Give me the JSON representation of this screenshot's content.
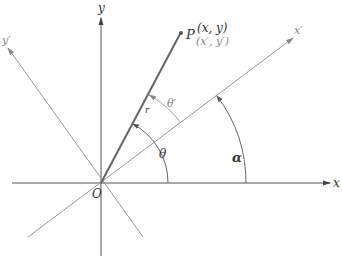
{
  "diagram": {
    "type": "coordinate-rotation",
    "origin": {
      "label": "O",
      "x": 101,
      "y": 183
    },
    "axes": {
      "x": {
        "label": "x",
        "color": "#555555"
      },
      "y": {
        "label": "y",
        "color": "#555555"
      },
      "x_prime": {
        "label": "x′",
        "color": "#999999"
      },
      "y_prime": {
        "label": "y′",
        "color": "#999999"
      }
    },
    "point": {
      "label": "P",
      "coords": "(x, y)",
      "coords_prime": "(x′, y′)",
      "x": 181,
      "y": 33
    },
    "radius_label": "r",
    "angles": {
      "theta": "θ",
      "theta_prime": "θ′",
      "alpha": "α"
    },
    "colors": {
      "axis": "#555555",
      "rotated_axis": "#999999",
      "vector": "#666666",
      "label": "#333333",
      "gray_label": "#888888"
    }
  }
}
